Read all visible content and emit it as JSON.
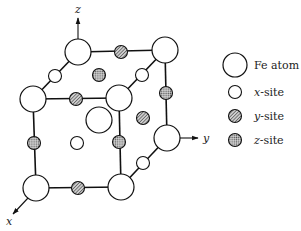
{
  "diagram": {
    "type": "crystal-structure-unit-cell",
    "axes": {
      "x": {
        "label": "x"
      },
      "y": {
        "label": "y"
      },
      "z": {
        "label": "z"
      }
    },
    "legend": [
      {
        "key": "fe",
        "symbol": "large-white-circle",
        "label": "Fe atom"
      },
      {
        "key": "x",
        "symbol": "small-white-circle",
        "label_var": "x",
        "label_suffix": "-site"
      },
      {
        "key": "y",
        "symbol": "hatched-circle",
        "label_var": "y",
        "label_suffix": "-site"
      },
      {
        "key": "z",
        "symbol": "stippled-circle",
        "label_var": "z",
        "label_suffix": "-site"
      }
    ],
    "fe_atoms": [
      {
        "id": "fe-top-back-left",
        "cx": 78,
        "cy": 52
      },
      {
        "id": "fe-top-back-right",
        "cx": 165,
        "cy": 50
      },
      {
        "id": "fe-top-front-left",
        "cx": 33,
        "cy": 99
      },
      {
        "id": "fe-top-front-right",
        "cx": 119,
        "cy": 98
      },
      {
        "id": "fe-body-center",
        "cx": 99,
        "cy": 120
      },
      {
        "id": "fe-bottom-back-right",
        "cx": 167,
        "cy": 138
      },
      {
        "id": "fe-bottom-front-left",
        "cx": 36,
        "cy": 188
      },
      {
        "id": "fe-bottom-front-right",
        "cx": 121,
        "cy": 187
      }
    ],
    "x_sites": [
      {
        "cx": 55,
        "cy": 76
      },
      {
        "cx": 142,
        "cy": 75
      },
      {
        "cx": 77,
        "cy": 143
      },
      {
        "cx": 143,
        "cy": 163
      }
    ],
    "y_sites": [
      {
        "cx": 121,
        "cy": 52
      },
      {
        "cx": 76,
        "cy": 99
      },
      {
        "cx": 78,
        "cy": 188
      },
      {
        "cx": 143,
        "cy": 118
      }
    ],
    "z_sites": [
      {
        "cx": 99,
        "cy": 75
      },
      {
        "cx": 166,
        "cy": 93
      },
      {
        "cx": 34,
        "cy": 143
      },
      {
        "cx": 119,
        "cy": 142
      }
    ]
  }
}
